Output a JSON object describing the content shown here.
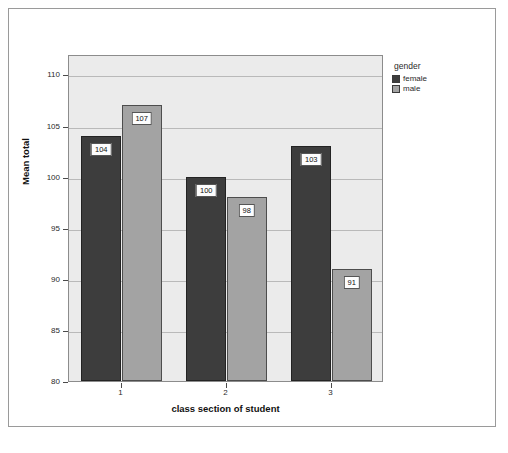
{
  "chart_data": {
    "type": "bar",
    "title": "Mean Total Points by Gender in Each Section",
    "xlabel": "class section of student",
    "ylabel": "Mean total",
    "categories": [
      "1",
      "2",
      "3"
    ],
    "series": [
      {
        "name": "female",
        "color": "#3d3d3d",
        "values": [
          104,
          100,
          103
        ]
      },
      {
        "name": "male",
        "color": "#a3a3a3",
        "values": [
          107,
          98,
          91
        ]
      }
    ],
    "ylim": [
      80,
      112
    ],
    "yticks": [
      80,
      85,
      90,
      95,
      100,
      105,
      110
    ],
    "ytick_labels": [
      "80",
      "85",
      "90",
      "95",
      "100",
      "105",
      "110"
    ],
    "grid": true,
    "data_labels": true,
    "legend": {
      "title": "gender",
      "position": "right",
      "entries": [
        "female",
        "male"
      ]
    },
    "plot_background": "#ebebeb",
    "figure_background": "#ffffff"
  }
}
